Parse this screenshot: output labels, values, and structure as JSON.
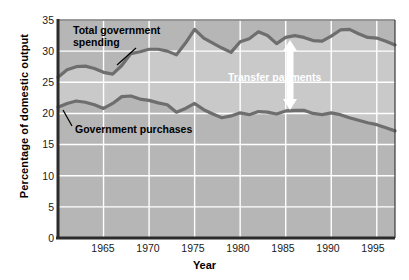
{
  "chart_data": {
    "type": "area",
    "title": "",
    "subtitle": "",
    "xlabel": "Year",
    "ylabel": "Percentage of domestic output",
    "xlim": [
      1960,
      1997
    ],
    "ylim": [
      0,
      35
    ],
    "yticks": [
      0,
      5,
      10,
      15,
      20,
      25,
      30,
      35
    ],
    "xticks": [
      1965,
      1970,
      1975,
      1980,
      1985,
      1990,
      1995
    ],
    "grid": true,
    "legend_position": "inline-annotations",
    "x": [
      1960,
      1961,
      1962,
      1963,
      1964,
      1965,
      1966,
      1967,
      1968,
      1969,
      1970,
      1971,
      1972,
      1973,
      1974,
      1975,
      1976,
      1977,
      1978,
      1979,
      1980,
      1981,
      1982,
      1983,
      1984,
      1985,
      1986,
      1987,
      1988,
      1989,
      1990,
      1991,
      1992,
      1993,
      1994,
      1995,
      1996,
      1997
    ],
    "series": [
      {
        "name": "Total government spending",
        "color": "#6e6e6e",
        "values": [
          25.8,
          27.0,
          27.5,
          27.6,
          27.2,
          26.6,
          26.3,
          27.7,
          29.6,
          29.9,
          30.3,
          30.3,
          30.0,
          29.4,
          31.3,
          33.5,
          32.1,
          31.3,
          30.5,
          29.8,
          31.5,
          32.0,
          33.1,
          32.5,
          31.2,
          32.2,
          32.5,
          32.2,
          31.7,
          31.6,
          32.4,
          33.4,
          33.5,
          32.8,
          32.2,
          32.1,
          31.6,
          31.0
        ]
      },
      {
        "name": "Government purchases",
        "color": "#6e6e6e",
        "values": [
          21.0,
          21.6,
          22.0,
          21.8,
          21.4,
          20.8,
          21.6,
          22.7,
          22.8,
          22.3,
          22.1,
          21.7,
          21.4,
          20.2,
          20.8,
          21.6,
          20.6,
          19.9,
          19.3,
          19.6,
          20.1,
          19.8,
          20.3,
          20.2,
          19.9,
          20.4,
          20.5,
          20.5,
          20.0,
          19.8,
          20.1,
          19.8,
          19.3,
          18.9,
          18.5,
          18.2,
          17.7,
          17.2
        ]
      }
    ],
    "annotations": [
      {
        "id": "total-government-spending-label",
        "text": "Total government\nspending",
        "x_px": 73,
        "y_px": 25
      },
      {
        "id": "government-purchases-label",
        "text": "Government purchases",
        "x_px": 75,
        "y_px": 124
      },
      {
        "id": "transfer-payments-label",
        "text": "Transfer payments",
        "x_px": 228,
        "y_px": 72,
        "color": "#ffffff"
      }
    ],
    "arrow": {
      "id": "transfer-payments-arrow",
      "style": "double-headed",
      "color": "#ffffff",
      "x_px": 290,
      "y_top_px": 40,
      "y_bottom_px": 110
    }
  },
  "style": {
    "plot_background": "#b6b6b6",
    "band_background": "#c9c9c9",
    "gridline_color": "#ffffff",
    "line_color": "#6e6e6e",
    "line_dark": "#5a5a5a",
    "frame_color": "#3a3a3a",
    "text_color": "#000000",
    "page_background": "#ffffff"
  }
}
